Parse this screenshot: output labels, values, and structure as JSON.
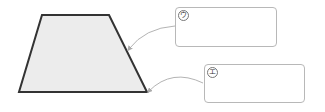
{
  "diagram": {
    "shape": {
      "type": "trapezoid",
      "fill": "#ececec",
      "stroke": "#333333",
      "vertices": {
        "top_left": [
          42,
          15
        ],
        "top_right": [
          109,
          15
        ],
        "bottom_right": [
          147,
          92
        ],
        "bottom_left": [
          19,
          92
        ]
      }
    },
    "callouts": [
      {
        "label": "ウ",
        "box": {
          "x": 175,
          "y": 7,
          "width": 102,
          "height": 40
        },
        "points_to": "right-side-edge"
      },
      {
        "label": "エ",
        "box": {
          "x": 204,
          "y": 64,
          "width": 101,
          "height": 39
        },
        "points_to": "bottom-right-vertex"
      }
    ],
    "colors": {
      "box_border": "#b8b8b8",
      "arrow": "#aaaaaa",
      "shape_outline": "#333333",
      "shape_fill": "#ececec"
    }
  }
}
